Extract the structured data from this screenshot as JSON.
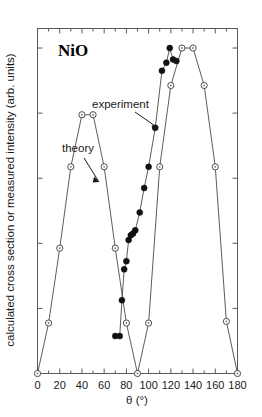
{
  "figure": {
    "sample_label": "NiO",
    "background_color": "#ffffff"
  },
  "annotations": {
    "experiment_label": "experiment",
    "theory_label": "theory"
  },
  "chart_data": {
    "type": "line",
    "title": "NiO",
    "xlabel": "θ (°)",
    "ylabel": "calculated cross section or measured intensity (arb. units)",
    "xlim": [
      0,
      180
    ],
    "ylim": [
      0,
      1.06
    ],
    "xticks": [
      0,
      20,
      40,
      60,
      80,
      100,
      120,
      140,
      160,
      180
    ],
    "xticklabels": [
      "0",
      "20",
      "40",
      "60",
      "80",
      "100",
      "120",
      "140",
      "160",
      "180"
    ],
    "xminor_interval": 10,
    "yticks": [
      0.0,
      0.2,
      0.4,
      0.6,
      0.8,
      1.0
    ],
    "yticklabels": [],
    "grid": false,
    "legend_position": "inline-annotations",
    "series": [
      {
        "name": "theory",
        "marker": "open-circle",
        "color": "#3a3a3a",
        "x": [
          0,
          10,
          20,
          30,
          40,
          50,
          60,
          70,
          80,
          90,
          100,
          110,
          120,
          130,
          140,
          150,
          160,
          170,
          180
        ],
        "y": [
          0.0,
          0.155,
          0.385,
          0.635,
          0.795,
          0.795,
          0.635,
          0.385,
          0.155,
          0.0,
          0.155,
          0.635,
          0.885,
          1.0,
          1.0,
          0.885,
          0.635,
          0.16,
          0.0
        ]
      },
      {
        "name": "experiment",
        "marker": "filled-circle",
        "color": "#111111",
        "x": [
          70,
          74,
          76,
          78,
          80,
          82,
          84,
          86,
          88,
          92,
          96,
          100,
          106,
          112,
          116,
          119,
          122,
          125
        ],
        "y": [
          0.115,
          0.115,
          0.225,
          0.32,
          0.345,
          0.41,
          0.425,
          0.43,
          0.44,
          0.495,
          0.57,
          0.635,
          0.755,
          0.93,
          0.955,
          1.0,
          0.965,
          0.96
        ]
      }
    ]
  }
}
